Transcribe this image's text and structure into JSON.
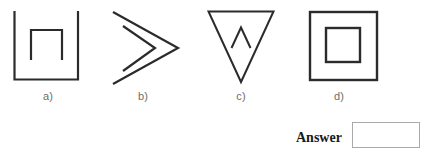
{
  "page": {
    "background_color": "#ffffff",
    "stroke_color": "#2b2b2b",
    "label_color": "#6c6c6c",
    "answer_text_color": "#1a1a1a",
    "answer_box_border_color": "#a9a9a9"
  },
  "options": [
    {
      "key": "a",
      "label": "a)",
      "figure_name": "cup-with-inverted-u-figure",
      "description": "open-top square bracket (U shape) containing an inverted U"
    },
    {
      "key": "b",
      "label": "b)",
      "figure_name": "double-chevron-figure",
      "description": "two nested right-pointing chevrons"
    },
    {
      "key": "c",
      "label": "c)",
      "figure_name": "down-triangle-with-caret-figure",
      "description": "downward pointing triangle containing a small caret"
    },
    {
      "key": "d",
      "label": "d)",
      "figure_name": "nested-squares-figure",
      "description": "square containing a smaller concentric square"
    }
  ],
  "answer": {
    "label": "Answer",
    "value": "",
    "placeholder": ""
  }
}
